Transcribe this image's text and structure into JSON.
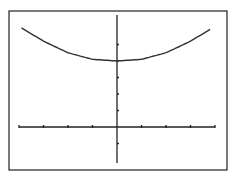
{
  "chart_data": {
    "type": "line",
    "title": "",
    "xlabel": "",
    "ylabel": "",
    "x_ticks": [
      -4,
      -3,
      -2,
      -1,
      1,
      2,
      3,
      4
    ],
    "y_ticks": [
      -1,
      1,
      2,
      3,
      4,
      5
    ],
    "xlim": [
      -4,
      4
    ],
    "ylim": [
      -2,
      6.5
    ],
    "series": [
      {
        "name": "curve",
        "x": [
          -4,
          -3,
          -2,
          -1,
          0,
          1,
          2,
          3,
          4
        ],
        "y": [
          6.1,
          5.2,
          4.5,
          4.1,
          4.0,
          4.1,
          4.5,
          5.2,
          6.1
        ]
      }
    ],
    "grid": false,
    "legend": false
  }
}
